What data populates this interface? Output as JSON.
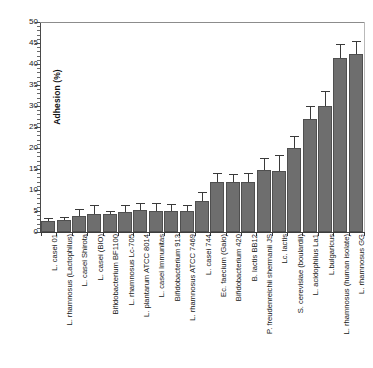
{
  "chart_data": {
    "type": "bar",
    "title": "",
    "xlabel": "",
    "ylabel": "Adhesion (%)",
    "ylim": [
      0,
      50
    ],
    "ytick_step": 5,
    "grid": false,
    "legend": "none",
    "bar_color": "#6e6e6e",
    "bar_edge_color": "#4f4f4f",
    "error_bar_color": "#3a3a3a",
    "ytick_labels": [
      "0",
      "5",
      "10",
      "15",
      "20",
      "25",
      "30",
      "35",
      "40",
      "45",
      "50"
    ],
    "categories": [
      "L. casei 01",
      "L. rhamnosus (Lactophilus)",
      "L. casei Shirota",
      "L. casei (BIO)",
      "Bifidobacterium BF1100",
      "L. rhamnosus Lc-705",
      "L. plantarum ATCC 8014",
      "L. casei Immunitas",
      "Bifidobacterium 913",
      "L. rhamnosus ATCC 7469",
      "L. casei 744",
      "Ec. faecium (Gaio)",
      "Bifidobacterium 420",
      "B. lactis BB12",
      "P. freudenreichii shermanii JS",
      "Lc. lactis",
      "S. cerevisiae (boulardii)",
      "L. acidophilus La1",
      "L.bulgaricus",
      "L. rhamnosus (human isolate)",
      "L. rhamnosus GG"
    ],
    "values": [
      2.6,
      2.9,
      3.9,
      4.4,
      4.3,
      4.8,
      5.2,
      5.1,
      5.1,
      5.0,
      7.5,
      11.9,
      12.0,
      11.8,
      14.8,
      14.6,
      20.1,
      26.8,
      30.0,
      41.5,
      42.5
    ],
    "errors": [
      0.6,
      0.5,
      1.3,
      1.7,
      0.5,
      1.3,
      1.5,
      1.6,
      1.3,
      1.2,
      1.9,
      1.8,
      1.6,
      1.9,
      2.5,
      3.5,
      2.5,
      3.0,
      3.4,
      3.0,
      2.7
    ]
  }
}
